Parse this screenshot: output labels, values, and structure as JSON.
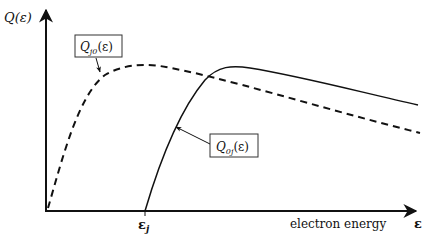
{
  "diagram": {
    "y_axis_label": "Q(ε)",
    "x_axis_label": "electron energy",
    "x_axis_symbol": "ε",
    "threshold_label": "ε",
    "threshold_subscript": "j",
    "curves": [
      {
        "id": "Q_j0",
        "label_main": "Q",
        "label_sub": "j0",
        "label_arg": "(ε)",
        "style": "dashed",
        "description": "reverse (de-excitation) cross section, rises from origin"
      },
      {
        "id": "Q_0j",
        "label_main": "Q",
        "label_sub": "0j",
        "label_arg": "(ε)",
        "style": "solid",
        "description": "excitation cross section, starts at threshold ε_j"
      }
    ],
    "colors": {
      "line": "#111111",
      "background": "#ffffff"
    }
  }
}
